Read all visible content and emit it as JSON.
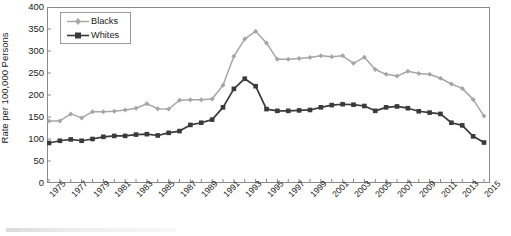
{
  "chart_data": {
    "type": "line",
    "title": "",
    "xlabel": "",
    "ylabel": "Rate per 100,000 Persons",
    "ylim": [
      0,
      400
    ],
    "ytick_step": 50,
    "yticks": [
      400,
      350,
      300,
      250,
      200,
      150,
      100,
      50,
      0
    ],
    "xlim": [
      1975,
      2015
    ],
    "xtick_step": 2,
    "xticks": [
      "1975",
      "1977",
      "1979",
      "1981",
      "1983",
      "1985",
      "1987",
      "1989",
      "1991",
      "1993",
      "1995",
      "1997",
      "1999",
      "2001",
      "2003",
      "2005",
      "2007",
      "2009",
      "2011",
      "2013",
      "2015"
    ],
    "x": [
      1975,
      1976,
      1977,
      1978,
      1979,
      1980,
      1981,
      1982,
      1983,
      1984,
      1985,
      1986,
      1987,
      1988,
      1989,
      1990,
      1991,
      1992,
      1993,
      1994,
      1995,
      1996,
      1997,
      1998,
      1999,
      2000,
      2001,
      2002,
      2003,
      2004,
      2005,
      2006,
      2007,
      2008,
      2009,
      2010,
      2011,
      2012,
      2013,
      2014,
      2015
    ],
    "grid": false,
    "legend_position": "top-left",
    "series": [
      {
        "name": "Blacks",
        "color": "#a6a6a6",
        "marker": "diamond",
        "values": [
          141,
          141,
          157,
          148,
          162,
          162,
          163,
          166,
          170,
          180,
          169,
          168,
          188,
          189,
          189,
          191,
          222,
          288,
          327,
          345,
          318,
          281,
          281,
          283,
          285,
          289,
          287,
          289,
          272,
          286,
          258,
          247,
          243,
          254,
          249,
          247,
          238,
          225,
          215,
          190,
          152
        ]
      },
      {
        "name": "Whites",
        "color": "#3a3a3a",
        "marker": "square",
        "values": [
          91,
          96,
          99,
          96,
          100,
          105,
          107,
          107,
          110,
          111,
          108,
          114,
          118,
          132,
          137,
          144,
          172,
          214,
          237,
          220,
          168,
          164,
          164,
          165,
          166,
          172,
          177,
          179,
          178,
          175,
          164,
          172,
          174,
          170,
          163,
          160,
          157,
          137,
          131,
          106,
          92
        ]
      }
    ]
  },
  "legend": {
    "items": [
      {
        "label": "Blacks"
      },
      {
        "label": "Whites"
      }
    ]
  },
  "axis": {
    "y_title": "Rate per 100,000 Persons"
  }
}
